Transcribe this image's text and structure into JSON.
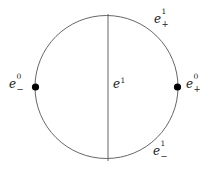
{
  "figure": {
    "type": "cw-complex-circle-diagram",
    "background_color": "#ffffff",
    "stroke_color": "#555555",
    "text_color": "#1a1a1a",
    "dot_color": "#000000"
  },
  "circle": {
    "center_x": 106.5,
    "center_y": 87,
    "radius": 71.5
  },
  "vertical_edge": {
    "x": 108,
    "y_top": 14,
    "y_bottom": 161
  },
  "vertices": [
    {
      "name": "left-vertex",
      "cx": 35.5,
      "cy": 87,
      "r": 3.6
    },
    {
      "name": "right-vertex",
      "cx": 177.5,
      "cy": 87,
      "r": 3.6
    }
  ],
  "labels": {
    "e0_minus": {
      "base": "e",
      "sup": "0",
      "sub": "−"
    },
    "e0_plus": {
      "base": "e",
      "sup": "0",
      "sub": "+"
    },
    "e1_plus": {
      "base": "e",
      "sup": "1",
      "sub": "+"
    },
    "e1_minus": {
      "base": "e",
      "sup": "1",
      "sub": "−"
    },
    "e1_mid": {
      "base": "e",
      "sup": "1",
      "sub": ""
    }
  }
}
